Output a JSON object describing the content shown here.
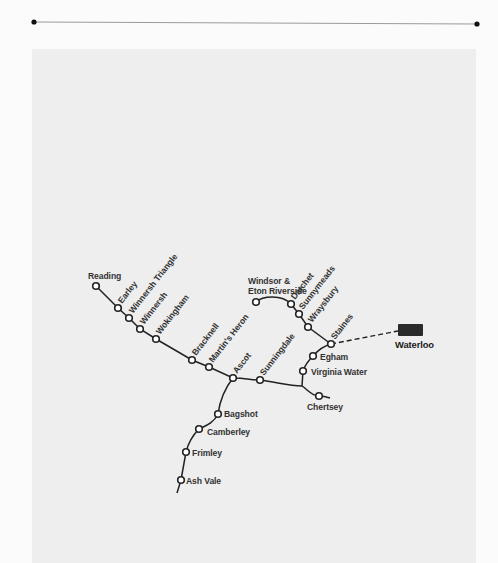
{
  "map": {
    "title": "",
    "colors": {
      "line": "#222222",
      "station_fill": "#ffffff",
      "terminus": "#2a2a2a",
      "panel": "#eeeeee"
    },
    "terminus": {
      "name": "Waterloo"
    },
    "stations": [
      {
        "name": "Reading"
      },
      {
        "name": "Earley"
      },
      {
        "name": "Winnersh Triangle"
      },
      {
        "name": "Winnersh"
      },
      {
        "name": "Wokingham"
      },
      {
        "name": "Bracknell"
      },
      {
        "name": "Martin's Heron"
      },
      {
        "name": "Ascot"
      },
      {
        "name": "Sunningdale"
      },
      {
        "name": "Bagshot"
      },
      {
        "name": "Camberley"
      },
      {
        "name": "Frimley"
      },
      {
        "name": "Ash Vale"
      },
      {
        "name_line1": "Windsor &",
        "name_line2": "Eton Riverside"
      },
      {
        "name": "Datchet"
      },
      {
        "name": "Sunnymeads"
      },
      {
        "name": "Wraysbury"
      },
      {
        "name": "Staines"
      },
      {
        "name": "Egham"
      },
      {
        "name": "Virginia Water"
      },
      {
        "name": "Chertsey"
      }
    ]
  }
}
